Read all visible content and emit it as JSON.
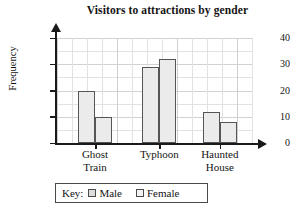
{
  "chart_data": {
    "type": "bar",
    "title": "Visitors to attractions by gender",
    "xlabel": "",
    "ylabel": "Frequency",
    "categories": [
      "Ghost Train",
      "Typhoon",
      "Haunted House"
    ],
    "series": [
      {
        "name": "Male",
        "values": [
          20,
          29,
          12
        ],
        "color": "#ebebeb"
      },
      {
        "name": "Female",
        "values": [
          10,
          32,
          8
        ],
        "color": "#ebebeb"
      }
    ],
    "ylim": [
      0,
      40
    ],
    "ytick_labels": [
      "0",
      "10",
      "20",
      "30",
      "40"
    ],
    "ytick_values": [
      0,
      10,
      20,
      30,
      40
    ],
    "minor_gridline_step": 5,
    "grid": true,
    "legend_position": "bottom"
  },
  "legend": {
    "key_label": "Key:",
    "items": [
      {
        "label": "Male",
        "swatch": "male-swatch"
      },
      {
        "label": "Female",
        "swatch": "female-swatch"
      }
    ]
  },
  "axis": {
    "y_title": "Frequency",
    "y_labels": [
      "40",
      "30",
      "20",
      "10",
      "0"
    ]
  },
  "categories_lines": [
    {
      "line1": "Ghost",
      "line2": "Train"
    },
    {
      "line1": "Typhoon",
      "line2": ""
    },
    {
      "line1": "Haunted",
      "line2": "House"
    }
  ]
}
